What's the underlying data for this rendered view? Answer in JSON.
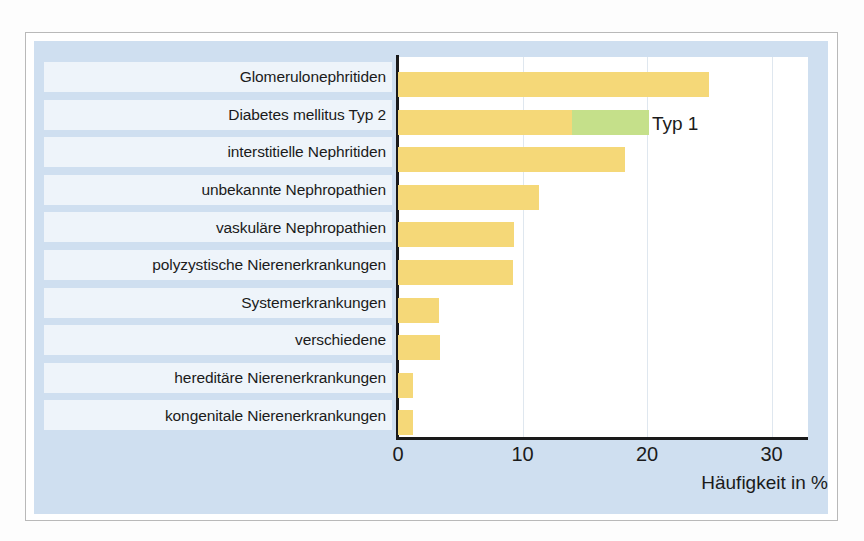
{
  "figure": {
    "panel_bg": "#cfdff0",
    "label_row_bg": "#eef4fa",
    "plot_bg": "#ffffff",
    "axis_color": "#1a1a1a",
    "grid_color": "#dfe7ef"
  },
  "chart_data": {
    "type": "bar",
    "orientation": "horizontal",
    "title": "",
    "subtitle": "",
    "xlabel": "Häufigkeit in %",
    "ylabel": "",
    "xlim": [
      0,
      33
    ],
    "xticks": [
      0,
      10,
      20,
      30
    ],
    "xtick_labels": [
      "0",
      "10",
      "20",
      "30"
    ],
    "grid": true,
    "grid_axis": "x",
    "legend": false,
    "stacked": true,
    "categories": [
      "Glomerulonephritiden",
      "Diabetes mellitus Typ 2",
      "interstitielle Nephritiden",
      "unbekannte Nephropathien",
      "vaskuläre Nephropathien",
      "polyzystische Nierenerkrankungen",
      "Systemerkrankungen",
      "verschiedene",
      "hereditäre Nierenerkrankungen",
      "kongenitale Nierenerkrankungen"
    ],
    "series": [
      {
        "name": "Typ 2",
        "color": "#f5d878",
        "values": [
          25.0,
          14.0,
          18.2,
          11.3,
          9.3,
          9.2,
          3.3,
          3.4,
          1.2,
          1.2
        ]
      },
      {
        "name": "Typ 1",
        "color": "#c5e08a",
        "values": [
          0,
          6.2,
          0,
          0,
          0,
          0,
          0,
          0,
          0,
          0
        ]
      }
    ],
    "annotations": [
      {
        "text": "Typ 1",
        "category": "Diabetes mellitus Typ 2",
        "x": 20.4
      }
    ]
  }
}
